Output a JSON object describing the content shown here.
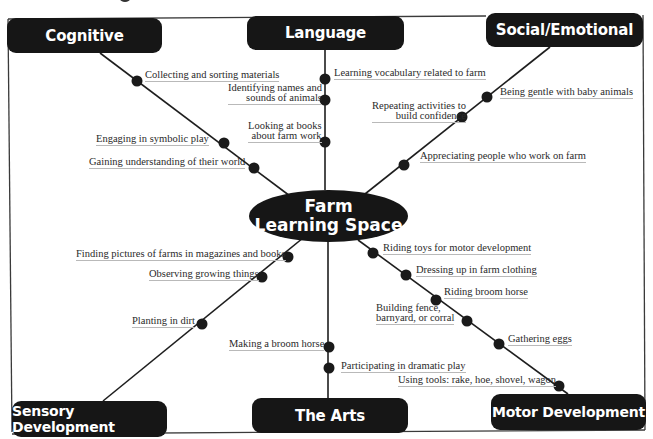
{
  "center": {
    "line1": "Farm",
    "line2": "Learning Space"
  },
  "domains": {
    "cognitive": "Cognitive",
    "language": "Language",
    "social": "Social/Emotional",
    "sensory": "Sensory Development",
    "arts": "The Arts",
    "motor": "Motor Development"
  },
  "activities": {
    "cognitive": [
      "Collecting and sorting materials",
      "Engaging in symbolic play",
      "Gaining understanding of their world"
    ],
    "language": [
      "Learning vocabulary related to farm",
      [
        "Identifying names and",
        "sounds of animals"
      ],
      [
        "Looking at books",
        "about farm work"
      ]
    ],
    "social": [
      "Being gentle with baby animals",
      [
        "Repeating activities to",
        "build confidence"
      ],
      "Appreciating people who work on farm"
    ],
    "sensory": [
      "Finding pictures of farms in magazines and books",
      "Observing growing things",
      "Planting in dirt"
    ],
    "arts": [
      "Making a broom horse",
      "Participating in dramatic play"
    ],
    "motor": [
      "Riding toys for motor development",
      "Dressing up in farm clothing",
      "Riding broom horse",
      [
        "Building fence,",
        "barnyard, or corral"
      ],
      "Gathering eggs",
      "Using tools: rake, hoe, shovel, wagon"
    ]
  },
  "colors": {
    "box_fill": "#161616",
    "box_text": "#ffffff",
    "line": "#1e1e1e",
    "label_text": "#2a2a2a",
    "underline": "#b9b9b9"
  }
}
